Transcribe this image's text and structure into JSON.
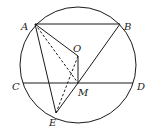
{
  "diagram": {
    "type": "geometry",
    "colors": {
      "stroke": "#1a1a1a",
      "label": "#222222",
      "background": "#ffffff"
    },
    "circle": {
      "center": "O",
      "cx": 78,
      "cy": 65,
      "r": 58
    },
    "points": {
      "A": {
        "label": "A",
        "x": 35,
        "y": 24,
        "lx": 21,
        "ly": 30
      },
      "B": {
        "label": "B",
        "x": 120,
        "y": 24,
        "lx": 124,
        "ly": 30
      },
      "O": {
        "label": "O",
        "x": 78,
        "y": 56,
        "lx": 73,
        "ly": 52
      },
      "C": {
        "label": "C",
        "x": 23,
        "y": 83,
        "lx": 12,
        "ly": 90
      },
      "D": {
        "label": "D",
        "x": 133,
        "y": 83,
        "lx": 137,
        "ly": 90
      },
      "M": {
        "label": "M",
        "x": 78,
        "y": 83,
        "lx": 78,
        "ly": 96
      },
      "E": {
        "label": "E",
        "x": 56,
        "y": 113,
        "lx": 49,
        "ly": 126
      }
    },
    "solid_segments": [
      [
        "A",
        "B"
      ],
      [
        "C",
        "D"
      ],
      [
        "A",
        "O"
      ],
      [
        "O",
        "M"
      ],
      [
        "M",
        "B"
      ],
      [
        "A",
        "E"
      ],
      [
        "M",
        "E"
      ]
    ],
    "dashed_segments": [
      [
        "A",
        "M"
      ],
      [
        "E",
        "O"
      ]
    ]
  }
}
